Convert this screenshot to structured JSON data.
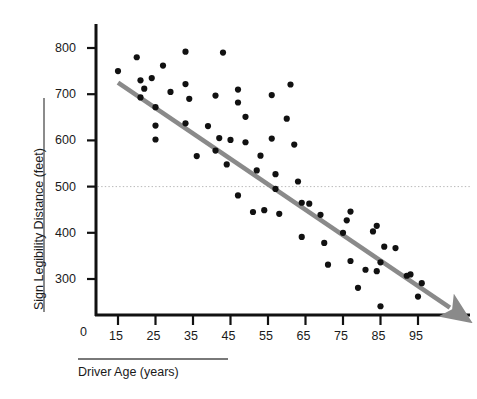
{
  "chart_data": {
    "type": "scatter",
    "title": "",
    "xlabel": "Driver Age (years)",
    "ylabel": "Sign Legibility Distance (feet)",
    "xlim": [
      10,
      105
    ],
    "ylim": [
      200,
      840
    ],
    "xticks": [
      15,
      25,
      35,
      45,
      55,
      65,
      75,
      85,
      95
    ],
    "yticks": [
      300,
      400,
      500,
      600,
      700,
      800
    ],
    "y_origin_label": "0",
    "grid": false,
    "legend": null,
    "marker_color": "#111111",
    "trendline_color": "#8a8a8a",
    "reference_line_color": "#b9b9b9",
    "reference_line": {
      "y": 500,
      "style": "dotted",
      "label": ""
    },
    "trendline": {
      "style": "solid-arrow",
      "x_start": 15,
      "y_start": 725,
      "x_end": 103.5,
      "y_end": 238,
      "slope": -5.5,
      "intercept": 807.5
    },
    "points": [
      {
        "x": 15,
        "y": 750
      },
      {
        "x": 20,
        "y": 780
      },
      {
        "x": 21,
        "y": 730
      },
      {
        "x": 22,
        "y": 712
      },
      {
        "x": 21,
        "y": 693
      },
      {
        "x": 24,
        "y": 735
      },
      {
        "x": 25,
        "y": 672
      },
      {
        "x": 25,
        "y": 632
      },
      {
        "x": 25,
        "y": 602
      },
      {
        "x": 27,
        "y": 762
      },
      {
        "x": 29,
        "y": 705
      },
      {
        "x": 33,
        "y": 792
      },
      {
        "x": 33,
        "y": 722
      },
      {
        "x": 34,
        "y": 690
      },
      {
        "x": 33,
        "y": 637
      },
      {
        "x": 36,
        "y": 566
      },
      {
        "x": 39,
        "y": 631
      },
      {
        "x": 41,
        "y": 697
      },
      {
        "x": 41,
        "y": 578
      },
      {
        "x": 42,
        "y": 605
      },
      {
        "x": 43,
        "y": 790
      },
      {
        "x": 44,
        "y": 548
      },
      {
        "x": 45,
        "y": 601
      },
      {
        "x": 47,
        "y": 710
      },
      {
        "x": 47,
        "y": 682
      },
      {
        "x": 47,
        "y": 481
      },
      {
        "x": 49,
        "y": 651
      },
      {
        "x": 49,
        "y": 596
      },
      {
        "x": 51,
        "y": 445
      },
      {
        "x": 52,
        "y": 535
      },
      {
        "x": 53,
        "y": 567
      },
      {
        "x": 54,
        "y": 449
      },
      {
        "x": 56,
        "y": 698
      },
      {
        "x": 56,
        "y": 604
      },
      {
        "x": 57,
        "y": 495
      },
      {
        "x": 57,
        "y": 527
      },
      {
        "x": 58,
        "y": 441
      },
      {
        "x": 60,
        "y": 647
      },
      {
        "x": 61,
        "y": 721
      },
      {
        "x": 62,
        "y": 591
      },
      {
        "x": 63,
        "y": 511
      },
      {
        "x": 64,
        "y": 465
      },
      {
        "x": 64,
        "y": 391
      },
      {
        "x": 66,
        "y": 463
      },
      {
        "x": 69,
        "y": 439
      },
      {
        "x": 70,
        "y": 378
      },
      {
        "x": 71,
        "y": 331
      },
      {
        "x": 75,
        "y": 400
      },
      {
        "x": 76,
        "y": 427
      },
      {
        "x": 77,
        "y": 446
      },
      {
        "x": 77,
        "y": 339
      },
      {
        "x": 79,
        "y": 281
      },
      {
        "x": 81,
        "y": 320
      },
      {
        "x": 83,
        "y": 403
      },
      {
        "x": 84,
        "y": 415
      },
      {
        "x": 84,
        "y": 317
      },
      {
        "x": 85,
        "y": 336
      },
      {
        "x": 85,
        "y": 241
      },
      {
        "x": 86,
        "y": 370
      },
      {
        "x": 89,
        "y": 367
      },
      {
        "x": 92,
        "y": 307
      },
      {
        "x": 93,
        "y": 310
      },
      {
        "x": 95,
        "y": 262
      },
      {
        "x": 96,
        "y": 291
      }
    ]
  },
  "axes": {
    "y_axis_name": "Sign Legibility Distance (feet)",
    "x_axis_name": "Driver Age (years)",
    "origin_tick": "0"
  }
}
